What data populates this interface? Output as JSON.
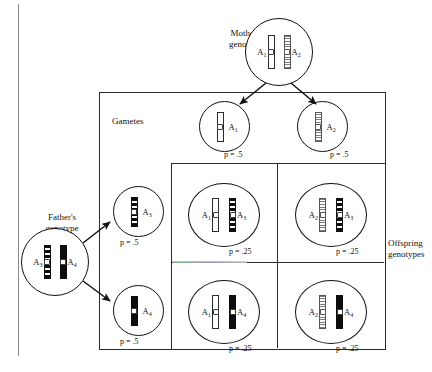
{
  "figure": {
    "top_cut_text": "",
    "labels": {
      "mother": "Mother's\ngenotype",
      "father": "Father's\ngenotype",
      "gametes": "Gametes",
      "offspring": "Offspring\ngenotypes"
    }
  },
  "parents": {
    "mother": {
      "name": "mother-genotype",
      "left_allele": "A",
      "left_sub": "1",
      "right_allele": "A",
      "right_sub": "2",
      "left_pattern": "white",
      "right_pattern": "dotted"
    },
    "father": {
      "name": "father-genotype",
      "left_allele": "A",
      "left_sub": "3",
      "right_allele": "A",
      "right_sub": "4",
      "left_pattern": "banded",
      "right_pattern": "solid"
    }
  },
  "gametes": {
    "mother": [
      {
        "allele": "A",
        "sub": "1",
        "pattern": "white",
        "p": "p = .5"
      },
      {
        "allele": "A",
        "sub": "2",
        "pattern": "dotted",
        "p": "p = .5"
      }
    ],
    "father": [
      {
        "allele": "A",
        "sub": "3",
        "pattern": "banded",
        "p": "p = .5"
      },
      {
        "allele": "A",
        "sub": "4",
        "pattern": "solid",
        "p": "p = .5"
      }
    ]
  },
  "offspring": [
    {
      "cell": "top-left",
      "left_allele": "A",
      "left_sub": "1",
      "left_pattern": "white",
      "right_allele": "A",
      "right_sub": "3",
      "right_pattern": "banded",
      "p": "p = .25"
    },
    {
      "cell": "top-right",
      "left_allele": "A",
      "left_sub": "2",
      "left_pattern": "dotted",
      "right_allele": "A",
      "right_sub": "3",
      "right_pattern": "banded",
      "p": "p = .25"
    },
    {
      "cell": "bottom-left",
      "left_allele": "A",
      "left_sub": "1",
      "left_pattern": "white",
      "right_allele": "A",
      "right_sub": "4",
      "right_pattern": "solid",
      "p": "p = .25"
    },
    {
      "cell": "bottom-right",
      "left_allele": "A",
      "left_sub": "2",
      "left_pattern": "dotted",
      "right_allele": "A",
      "right_sub": "4",
      "right_pattern": "solid",
      "p": "p = .25"
    }
  ],
  "colors": {
    "ink": "#111111",
    "rule": "#8a8a8a",
    "chromosome_dark": "#0d0d0d",
    "chromosome_stipple": "#7d7d7d",
    "paper": "#ffffff"
  }
}
